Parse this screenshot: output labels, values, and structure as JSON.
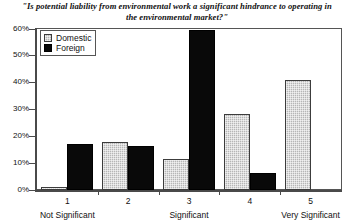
{
  "chart_data": {
    "type": "bar",
    "title": "\"Is potential liability from environmental work a significant hindrance to operating in the environmental market?\"",
    "xlabel": "",
    "ylabel": "",
    "categories": [
      "1",
      "2",
      "3",
      "4",
      "5"
    ],
    "category_anchors": [
      {
        "category": "1",
        "label": "Not Significant"
      },
      {
        "category": "3",
        "label": "Significant"
      },
      {
        "category": "5",
        "label": "Very Significant"
      }
    ],
    "series": [
      {
        "name": "Domestic",
        "color": "#b6b6b6",
        "pattern": "dotted-gray",
        "values": [
          1,
          18,
          11.5,
          28.5,
          41
        ]
      },
      {
        "name": "Foreign",
        "color": "#090909",
        "pattern": "solid-black",
        "values": [
          17,
          16.5,
          59.5,
          6.5,
          0
        ]
      }
    ],
    "ylim": [
      0,
      60
    ],
    "yticks": [
      0,
      10,
      20,
      30,
      40,
      50,
      60
    ],
    "ytick_labels": [
      "0%",
      "10%",
      "20%",
      "30%",
      "40%",
      "50%",
      "60%"
    ],
    "grid": false,
    "legend_position": "top-left",
    "legend_entries": [
      "Domestic",
      "Foreign"
    ]
  }
}
